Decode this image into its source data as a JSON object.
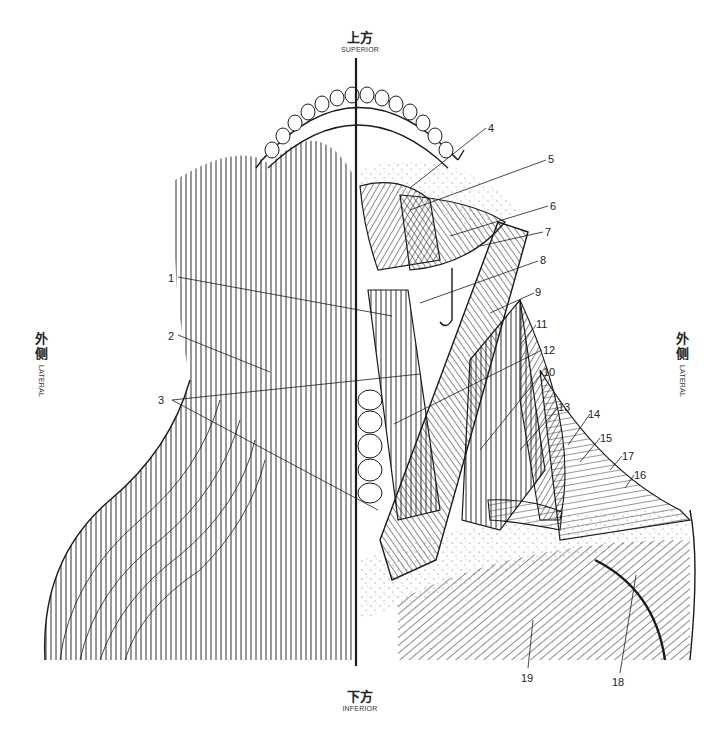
{
  "figure": {
    "orientation": {
      "top": {
        "zh": "上方",
        "en": "SUPERIOR"
      },
      "bottom": {
        "zh": "下方",
        "en": "INFERIOR"
      },
      "left": {
        "zh1": "外",
        "zh2": "侧",
        "en": "LATERAL"
      },
      "right": {
        "zh1": "外",
        "zh2": "侧",
        "en": "LATERAL"
      }
    },
    "callouts": [
      {
        "id": "1",
        "label": "1",
        "x": 168,
        "y": 272
      },
      {
        "id": "2",
        "label": "2",
        "x": 168,
        "y": 330
      },
      {
        "id": "3",
        "label": "3",
        "x": 158,
        "y": 394
      },
      {
        "id": "4",
        "label": "4",
        "x": 488,
        "y": 122
      },
      {
        "id": "5",
        "label": "5",
        "x": 548,
        "y": 153
      },
      {
        "id": "6",
        "label": "6",
        "x": 550,
        "y": 200
      },
      {
        "id": "7",
        "label": "7",
        "x": 545,
        "y": 226
      },
      {
        "id": "8",
        "label": "8",
        "x": 540,
        "y": 254
      },
      {
        "id": "9",
        "label": "9",
        "x": 535,
        "y": 286
      },
      {
        "id": "11",
        "label": "11",
        "x": 536,
        "y": 318
      },
      {
        "id": "12",
        "label": "12",
        "x": 543,
        "y": 344
      },
      {
        "id": "10",
        "label": "10",
        "x": 543,
        "y": 366
      },
      {
        "id": "13",
        "label": "13",
        "x": 558,
        "y": 401
      },
      {
        "id": "14",
        "label": "14",
        "x": 588,
        "y": 408
      },
      {
        "id": "15",
        "label": "15",
        "x": 600,
        "y": 432
      },
      {
        "id": "17",
        "label": "17",
        "x": 622,
        "y": 450
      },
      {
        "id": "16",
        "label": "16",
        "x": 634,
        "y": 469
      },
      {
        "id": "19",
        "label": "19",
        "x": 521,
        "y": 672
      },
      {
        "id": "18",
        "label": "18",
        "x": 612,
        "y": 676
      }
    ]
  },
  "colors": {
    "ink": "#1a1a1a",
    "background": "#ffffff",
    "stipple": "#555555"
  }
}
